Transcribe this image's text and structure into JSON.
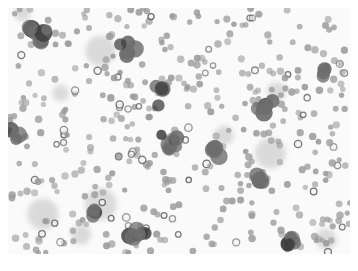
{
  "image": {
    "description": "Grayscale microscopy image of a blood smear showing clusters of large nucleated cells among many small round red blood cells",
    "colors": {
      "background": "#fafafa",
      "border": "#ffffff",
      "rbc": "#9a9a9a",
      "rbc_ring": "#5a5a5a",
      "blast": "#6e6e6e",
      "blast_dark": "#3c3c3c",
      "smudge": "#c4c4c4"
    },
    "clusters": [
      {
        "cx": 38,
        "cy": 40,
        "r": 20
      },
      {
        "cx": 130,
        "cy": 50,
        "r": 16
      },
      {
        "cx": 160,
        "cy": 95,
        "r": 14
      },
      {
        "cx": 170,
        "cy": 145,
        "r": 18
      },
      {
        "cx": 212,
        "cy": 150,
        "r": 14
      },
      {
        "cx": 265,
        "cy": 105,
        "r": 12
      },
      {
        "cx": 260,
        "cy": 180,
        "r": 12
      },
      {
        "cx": 140,
        "cy": 235,
        "r": 18
      },
      {
        "cx": 95,
        "cy": 210,
        "r": 10
      },
      {
        "cx": 290,
        "cy": 240,
        "r": 12
      },
      {
        "cx": 15,
        "cy": 135,
        "r": 8
      },
      {
        "cx": 325,
        "cy": 70,
        "r": 10
      }
    ]
  }
}
